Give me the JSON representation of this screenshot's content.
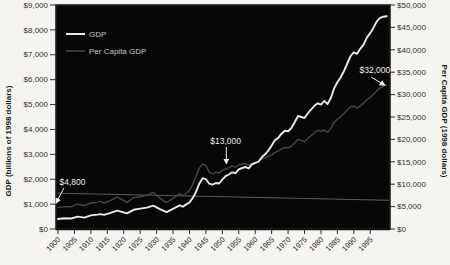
{
  "figure": {
    "colors": {
      "page_background": "#f5f4f1",
      "plot_background": "#070707",
      "frame": "#1f1f1f",
      "tick": "#2e2e2e",
      "gdp_line": "#e8e8e8",
      "per_capita_line": "#464646",
      "unlabeled_line": "#5d5d5d",
      "annotation": "#ececec"
    }
  },
  "chart_data": {
    "type": "line",
    "title": "",
    "x_axis": {
      "range": [
        1900,
        2001
      ],
      "tick_years": [
        1900,
        1905,
        1910,
        1915,
        1920,
        1925,
        1930,
        1935,
        1940,
        1945,
        1950,
        1955,
        1960,
        1965,
        1970,
        1975,
        1980,
        1985,
        1990,
        1995
      ],
      "tick_labels": [
        "1900",
        "1905",
        "1910",
        "1915",
        "1920",
        "1925",
        "1930",
        "1935",
        "1940",
        "1945",
        "1950",
        "1955",
        "1960",
        "1965",
        "1970",
        "1975",
        "1980",
        "1985",
        "1990",
        "1995"
      ],
      "label_rotation": -45
    },
    "left_axis": {
      "title": "GDP (billions of 1998 dollars)",
      "range": [
        0,
        9000
      ],
      "tick_values": [
        0,
        1000,
        2000,
        3000,
        4000,
        5000,
        6000,
        7000,
        8000,
        9000
      ],
      "tick_labels": [
        "$0",
        "$1,000",
        "$2,000",
        "$3,000",
        "$4,000",
        "$5,000",
        "$6,000",
        "$7,000",
        "$8,000",
        "$9,000"
      ]
    },
    "right_axis": {
      "title": "Per Capita GDP (1998 dollars)",
      "range": [
        0,
        50000
      ],
      "tick_values": [
        0,
        5000,
        10000,
        15000,
        20000,
        25000,
        30000,
        35000,
        40000,
        45000,
        50000
      ],
      "tick_labels": [
        "$0",
        "$5,000",
        "$10,000",
        "$15,000",
        "$20,000",
        "$25,000",
        "$30,000",
        "$35,000",
        "$40,000",
        "$45,000",
        "$50,000"
      ]
    },
    "legend": {
      "position": "top-left-inside",
      "items": [
        {
          "label": "GDP",
          "color": "#e8e8e8",
          "stroke_width": 2
        },
        {
          "label": "Per Capita GDP",
          "color": "#464646",
          "stroke_width": 1.5
        }
      ]
    },
    "series": [
      {
        "name": "unlabeled gray line",
        "axis": "right",
        "color": "#5d5d5d",
        "stroke_width": 1,
        "points": [
          [
            1900,
            8000
          ],
          [
            2001,
            6400
          ]
        ]
      },
      {
        "name": "Per Capita GDP",
        "axis": "right",
        "color": "#464646",
        "stroke_width": 1.4,
        "points": [
          [
            1900,
            4800
          ],
          [
            1902,
            5000
          ],
          [
            1904,
            4950
          ],
          [
            1906,
            5600
          ],
          [
            1908,
            5200
          ],
          [
            1910,
            5800
          ],
          [
            1912,
            6000
          ],
          [
            1913,
            6150
          ],
          [
            1914,
            5800
          ],
          [
            1916,
            6400
          ],
          [
            1918,
            7100
          ],
          [
            1920,
            6400
          ],
          [
            1921,
            5900
          ],
          [
            1923,
            7000
          ],
          [
            1925,
            7200
          ],
          [
            1927,
            7500
          ],
          [
            1929,
            8200
          ],
          [
            1931,
            6900
          ],
          [
            1933,
            5900
          ],
          [
            1935,
            6800
          ],
          [
            1937,
            7900
          ],
          [
            1938,
            7400
          ],
          [
            1939,
            8000
          ],
          [
            1940,
            8600
          ],
          [
            1941,
            10000
          ],
          [
            1942,
            11800
          ],
          [
            1943,
            13600
          ],
          [
            1944,
            14500
          ],
          [
            1945,
            14200
          ],
          [
            1946,
            12700
          ],
          [
            1947,
            12300
          ],
          [
            1948,
            12700
          ],
          [
            1949,
            12500
          ],
          [
            1950,
            13100
          ],
          [
            1951,
            13400
          ],
          [
            1952,
            13700
          ],
          [
            1953,
            14100
          ],
          [
            1954,
            13800
          ],
          [
            1955,
            14300
          ],
          [
            1956,
            14500
          ],
          [
            1957,
            14600
          ],
          [
            1958,
            14200
          ],
          [
            1959,
            14700
          ],
          [
            1960,
            14900
          ],
          [
            1961,
            15100
          ],
          [
            1962,
            15600
          ],
          [
            1963,
            15900
          ],
          [
            1964,
            16200
          ],
          [
            1965,
            16500
          ],
          [
            1966,
            17100
          ],
          [
            1967,
            17400
          ],
          [
            1968,
            17900
          ],
          [
            1969,
            18200
          ],
          [
            1970,
            18100
          ],
          [
            1971,
            18500
          ],
          [
            1972,
            19200
          ],
          [
            1973,
            20000
          ],
          [
            1974,
            19800
          ],
          [
            1975,
            19500
          ],
          [
            1976,
            20200
          ],
          [
            1977,
            20800
          ],
          [
            1978,
            21500
          ],
          [
            1979,
            22000
          ],
          [
            1980,
            21800
          ],
          [
            1981,
            22100
          ],
          [
            1982,
            21600
          ],
          [
            1983,
            22400
          ],
          [
            1984,
            23800
          ],
          [
            1985,
            24500
          ],
          [
            1986,
            25100
          ],
          [
            1987,
            25800
          ],
          [
            1988,
            26600
          ],
          [
            1989,
            27300
          ],
          [
            1990,
            27400
          ],
          [
            1991,
            27000
          ],
          [
            1992,
            27500
          ],
          [
            1993,
            28100
          ],
          [
            1994,
            28900
          ],
          [
            1995,
            29400
          ],
          [
            1996,
            30100
          ],
          [
            1997,
            30900
          ],
          [
            1998,
            31500
          ],
          [
            1999,
            31900
          ],
          [
            2000,
            32200
          ]
        ]
      },
      {
        "name": "GDP",
        "axis": "left",
        "color": "#e8e8e8",
        "stroke_width": 1.9,
        "points": [
          [
            1900,
            400
          ],
          [
            1902,
            430
          ],
          [
            1904,
            420
          ],
          [
            1906,
            500
          ],
          [
            1908,
            460
          ],
          [
            1910,
            545
          ],
          [
            1912,
            580
          ],
          [
            1913,
            600
          ],
          [
            1914,
            565
          ],
          [
            1916,
            650
          ],
          [
            1918,
            735
          ],
          [
            1920,
            665
          ],
          [
            1921,
            625
          ],
          [
            1923,
            770
          ],
          [
            1925,
            820
          ],
          [
            1927,
            860
          ],
          [
            1929,
            940
          ],
          [
            1931,
            800
          ],
          [
            1933,
            680
          ],
          [
            1935,
            810
          ],
          [
            1937,
            950
          ],
          [
            1938,
            895
          ],
          [
            1939,
            990
          ],
          [
            1940,
            1065
          ],
          [
            1941,
            1250
          ],
          [
            1942,
            1500
          ],
          [
            1943,
            1820
          ],
          [
            1944,
            2040
          ],
          [
            1945,
            2000
          ],
          [
            1946,
            1820
          ],
          [
            1947,
            1780
          ],
          [
            1948,
            1850
          ],
          [
            1949,
            1830
          ],
          [
            1950,
            1990
          ],
          [
            1951,
            2120
          ],
          [
            1952,
            2190
          ],
          [
            1953,
            2280
          ],
          [
            1954,
            2240
          ],
          [
            1955,
            2400
          ],
          [
            1956,
            2450
          ],
          [
            1957,
            2490
          ],
          [
            1958,
            2440
          ],
          [
            1959,
            2600
          ],
          [
            1960,
            2650
          ],
          [
            1961,
            2710
          ],
          [
            1962,
            2880
          ],
          [
            1963,
            3000
          ],
          [
            1964,
            3160
          ],
          [
            1965,
            3350
          ],
          [
            1966,
            3570
          ],
          [
            1967,
            3660
          ],
          [
            1968,
            3830
          ],
          [
            1969,
            3950
          ],
          [
            1970,
            3930
          ],
          [
            1971,
            4060
          ],
          [
            1972,
            4290
          ],
          [
            1973,
            4540
          ],
          [
            1974,
            4500
          ],
          [
            1975,
            4460
          ],
          [
            1976,
            4650
          ],
          [
            1977,
            4800
          ],
          [
            1978,
            4950
          ],
          [
            1979,
            5050
          ],
          [
            1980,
            5000
          ],
          [
            1981,
            5150
          ],
          [
            1982,
            5020
          ],
          [
            1983,
            5250
          ],
          [
            1984,
            5650
          ],
          [
            1985,
            5900
          ],
          [
            1986,
            6100
          ],
          [
            1987,
            6350
          ],
          [
            1988,
            6650
          ],
          [
            1989,
            6950
          ],
          [
            1990,
            7100
          ],
          [
            1991,
            7040
          ],
          [
            1992,
            7250
          ],
          [
            1993,
            7420
          ],
          [
            1994,
            7700
          ],
          [
            1995,
            7880
          ],
          [
            1996,
            8100
          ],
          [
            1997,
            8350
          ],
          [
            1998,
            8480
          ],
          [
            1999,
            8530
          ],
          [
            2000,
            8550
          ]
        ]
      }
    ],
    "annotations": [
      {
        "text": "$4,800",
        "points_to": "Per Capita GDP",
        "text_at": {
          "year": 1904.4,
          "right_value": 10600
        },
        "arrow_from": {
          "year": 1901.8,
          "right_value": 9150
        },
        "arrow_to": {
          "year": 1899.4,
          "right_value": 5800
        }
      },
      {
        "text": "$13,000",
        "points_to": "Per Capita GDP",
        "text_at": {
          "year": 1951.0,
          "right_value": 19600
        },
        "arrow_from": {
          "year": 1951.2,
          "right_value": 18300
        },
        "arrow_to": {
          "year": 1951.2,
          "right_value": 14600
        }
      },
      {
        "text": "$32,000",
        "points_to": "Per Capita GDP",
        "text_at": {
          "year": 1996.4,
          "right_value": 35500
        },
        "arrow_from": {
          "year": 1995.3,
          "right_value": 33900
        },
        "arrow_to": {
          "year": 1999.4,
          "right_value": 32100
        }
      }
    ]
  }
}
